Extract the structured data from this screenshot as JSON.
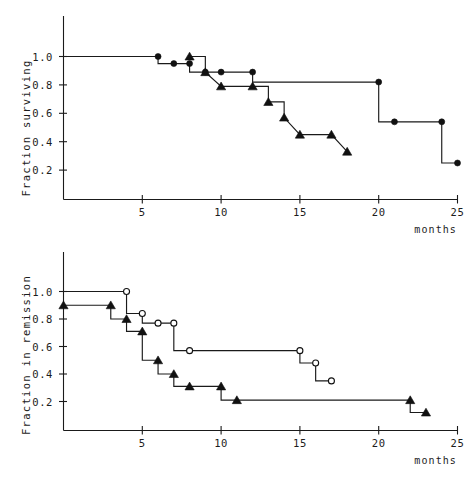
{
  "figure": {
    "kind": "two-panel-kaplan-meier-survival-figure",
    "background_color": "#ffffff",
    "line_color": "#1a1a1a"
  },
  "chart_data": [
    {
      "type": "line",
      "panel": "top",
      "title": "",
      "subtitle": "",
      "xlabel": "months",
      "ylabel": "Fraction surviving",
      "xlim": [
        0,
        25
      ],
      "ylim": [
        0,
        1.12
      ],
      "xticks": [
        5,
        10,
        15,
        20,
        25
      ],
      "xtick_labels": [
        "5",
        "10",
        "15",
        "20",
        "25"
      ],
      "yticks": [
        0.2,
        0.4,
        0.6,
        0.8,
        1.0
      ],
      "ytick_labels": [
        "0.2",
        "0.4",
        "0.6",
        "0.8",
        "1.0"
      ],
      "grid": false,
      "legend": "none",
      "step_style": "post-step Kaplan-Meier",
      "series": [
        {
          "name": "filled-circle-series",
          "marker": "filled-circle",
          "x": [
            0,
            6,
            6,
            7,
            8,
            8,
            9,
            10,
            12,
            12,
            20,
            20,
            21,
            24,
            24,
            25
          ],
          "y": [
            1.0,
            1.0,
            0.95,
            0.95,
            0.95,
            0.89,
            0.89,
            0.89,
            0.89,
            0.82,
            0.82,
            0.54,
            0.54,
            0.54,
            0.25,
            0.25
          ],
          "marker_points": [
            {
              "x": 6,
              "y": 1.0
            },
            {
              "x": 7,
              "y": 0.95
            },
            {
              "x": 8,
              "y": 0.95
            },
            {
              "x": 9,
              "y": 0.89
            },
            {
              "x": 10,
              "y": 0.89
            },
            {
              "x": 12,
              "y": 0.89
            },
            {
              "x": 20,
              "y": 0.82
            },
            {
              "x": 21,
              "y": 0.54
            },
            {
              "x": 24,
              "y": 0.54
            },
            {
              "x": 25,
              "y": 0.25
            }
          ]
        },
        {
          "name": "filled-triangle-series",
          "marker": "filled-triangle",
          "x": [
            8,
            9,
            9,
            10,
            12,
            12,
            13,
            13,
            14,
            14,
            15,
            17,
            17,
            18
          ],
          "y": [
            1.0,
            1.0,
            0.89,
            0.79,
            0.79,
            0.79,
            0.79,
            0.68,
            0.68,
            0.57,
            0.45,
            0.45,
            0.45,
            0.33
          ],
          "marker_points": [
            {
              "x": 8,
              "y": 1.0
            },
            {
              "x": 9,
              "y": 0.89
            },
            {
              "x": 10,
              "y": 0.79
            },
            {
              "x": 12,
              "y": 0.79
            },
            {
              "x": 13,
              "y": 0.68
            },
            {
              "x": 14,
              "y": 0.57
            },
            {
              "x": 15,
              "y": 0.45
            },
            {
              "x": 17,
              "y": 0.45
            },
            {
              "x": 18,
              "y": 0.33
            }
          ]
        }
      ]
    },
    {
      "type": "line",
      "panel": "bottom",
      "title": "",
      "subtitle": "",
      "xlabel": "months",
      "ylabel": "Fraction in remission",
      "xlim": [
        0,
        25
      ],
      "ylim": [
        0,
        1.12
      ],
      "xticks": [
        5,
        10,
        15,
        20,
        25
      ],
      "xtick_labels": [
        "5",
        "10",
        "15",
        "20",
        "25"
      ],
      "yticks": [
        0.2,
        0.4,
        0.6,
        0.8,
        1.0
      ],
      "ytick_labels": [
        "0.2",
        "0.4",
        "0.6",
        "0.8",
        "1.0"
      ],
      "grid": false,
      "legend": "none",
      "step_style": "post-step Kaplan-Meier",
      "series": [
        {
          "name": "open-circle-series",
          "marker": "open-circle",
          "x": [
            0,
            4,
            4,
            5,
            5,
            6,
            7,
            7,
            8,
            15,
            15,
            16,
            16,
            17
          ],
          "y": [
            1.0,
            1.0,
            0.84,
            0.84,
            0.77,
            0.77,
            0.77,
            0.57,
            0.57,
            0.57,
            0.48,
            0.48,
            0.35,
            0.35
          ],
          "marker_points": [
            {
              "x": 4,
              "y": 1.0
            },
            {
              "x": 5,
              "y": 0.84
            },
            {
              "x": 6,
              "y": 0.77
            },
            {
              "x": 7,
              "y": 0.77
            },
            {
              "x": 8,
              "y": 0.57
            },
            {
              "x": 15,
              "y": 0.57
            },
            {
              "x": 16,
              "y": 0.48
            },
            {
              "x": 17,
              "y": 0.35
            }
          ]
        },
        {
          "name": "filled-triangle-series",
          "marker": "filled-triangle",
          "x": [
            0,
            3,
            3,
            4,
            4,
            5,
            5,
            6,
            6,
            7,
            7,
            8,
            10,
            10,
            11,
            22,
            22,
            23
          ],
          "y": [
            0.9,
            0.9,
            0.8,
            0.8,
            0.71,
            0.71,
            0.5,
            0.5,
            0.4,
            0.4,
            0.31,
            0.31,
            0.31,
            0.21,
            0.21,
            0.21,
            0.12,
            0.12
          ],
          "marker_points": [
            {
              "x": 0,
              "y": 0.9
            },
            {
              "x": 3,
              "y": 0.9
            },
            {
              "x": 4,
              "y": 0.8
            },
            {
              "x": 5,
              "y": 0.71
            },
            {
              "x": 6,
              "y": 0.5
            },
            {
              "x": 7,
              "y": 0.4
            },
            {
              "x": 8,
              "y": 0.31
            },
            {
              "x": 10,
              "y": 0.31
            },
            {
              "x": 11,
              "y": 0.21
            },
            {
              "x": 22,
              "y": 0.21
            },
            {
              "x": 23,
              "y": 0.12
            }
          ]
        }
      ]
    }
  ]
}
